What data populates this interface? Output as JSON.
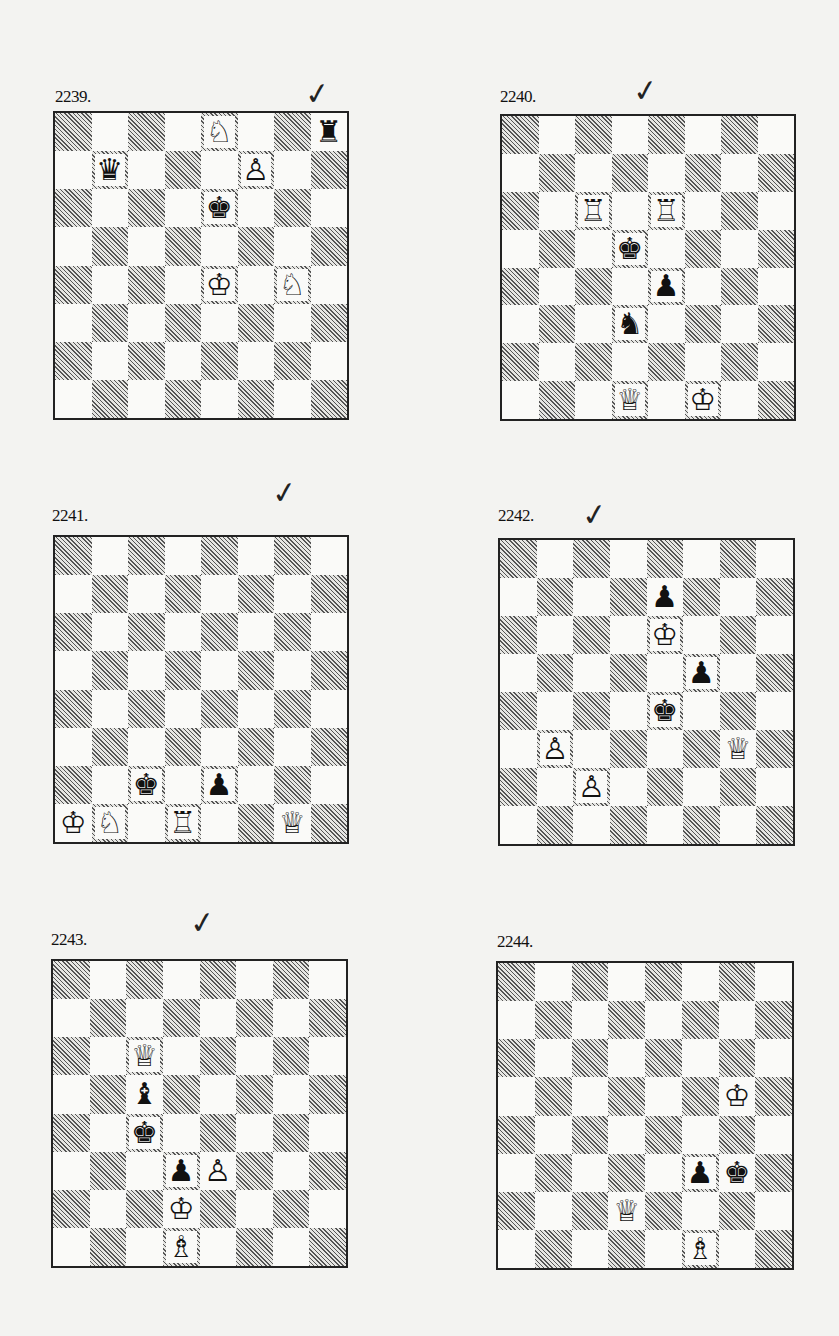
{
  "page": {
    "diagrams": [
      {
        "number": "2239.",
        "checked": true,
        "check_mark": "✓",
        "label_pos": [
          55,
          87
        ],
        "check_pos": [
          305,
          79
        ],
        "board": {
          "x": 53,
          "y": 111,
          "w": 296,
          "h": 309
        },
        "pieces": [
          {
            "square": "e8",
            "color": "white",
            "type": "knight",
            "glyph": "♘"
          },
          {
            "square": "h8",
            "color": "black",
            "type": "rook",
            "glyph": "♜"
          },
          {
            "square": "b7",
            "color": "black",
            "type": "queen",
            "glyph": "♛"
          },
          {
            "square": "f7",
            "color": "white",
            "type": "pawn",
            "glyph": "♙"
          },
          {
            "square": "e6",
            "color": "black",
            "type": "king",
            "glyph": "♚"
          },
          {
            "square": "e4",
            "color": "white",
            "type": "king",
            "glyph": "♔"
          },
          {
            "square": "g4",
            "color": "white",
            "type": "knight",
            "glyph": "♘"
          }
        ]
      },
      {
        "number": "2240.",
        "checked": true,
        "check_mark": "✓",
        "label_pos": [
          500,
          87
        ],
        "check_pos": [
          633,
          76
        ],
        "board": {
          "x": 500,
          "y": 114,
          "w": 296,
          "h": 307
        },
        "pieces": [
          {
            "square": "c6",
            "color": "white",
            "type": "rook",
            "glyph": "♖"
          },
          {
            "square": "e6",
            "color": "white",
            "type": "rook",
            "glyph": "♖"
          },
          {
            "square": "d5",
            "color": "black",
            "type": "king",
            "glyph": "♚"
          },
          {
            "square": "e4",
            "color": "black",
            "type": "pawn",
            "glyph": "♟"
          },
          {
            "square": "d3",
            "color": "black",
            "type": "knight",
            "glyph": "♞"
          },
          {
            "square": "d1",
            "color": "white",
            "type": "queen",
            "glyph": "♕"
          },
          {
            "square": "f1",
            "color": "white",
            "type": "king",
            "glyph": "♔"
          }
        ]
      },
      {
        "number": "2241.",
        "checked": true,
        "check_mark": "✓",
        "label_pos": [
          52,
          506
        ],
        "check_pos": [
          272,
          478
        ],
        "board": {
          "x": 53,
          "y": 535,
          "w": 296,
          "h": 309
        },
        "pieces": [
          {
            "square": "c2",
            "color": "black",
            "type": "king",
            "glyph": "♚"
          },
          {
            "square": "e2",
            "color": "black",
            "type": "pawn",
            "glyph": "♟"
          },
          {
            "square": "a1",
            "color": "white",
            "type": "king",
            "glyph": "♔"
          },
          {
            "square": "b1",
            "color": "white",
            "type": "knight",
            "glyph": "♘"
          },
          {
            "square": "d1",
            "color": "white",
            "type": "rook",
            "glyph": "♖"
          },
          {
            "square": "g1",
            "color": "white",
            "type": "queen",
            "glyph": "♕"
          }
        ]
      },
      {
        "number": "2242.",
        "checked": true,
        "check_mark": "✓",
        "label_pos": [
          498,
          506
        ],
        "check_pos": [
          582,
          500
        ],
        "board": {
          "x": 498,
          "y": 538,
          "w": 297,
          "h": 308
        },
        "pieces": [
          {
            "square": "e7",
            "color": "black",
            "type": "pawn",
            "glyph": "♟"
          },
          {
            "square": "e6",
            "color": "white",
            "type": "king",
            "glyph": "♔"
          },
          {
            "square": "f5",
            "color": "black",
            "type": "pawn",
            "glyph": "♟"
          },
          {
            "square": "e4",
            "color": "black",
            "type": "king",
            "glyph": "♚"
          },
          {
            "square": "b3",
            "color": "white",
            "type": "pawn",
            "glyph": "♙"
          },
          {
            "square": "g3",
            "color": "white",
            "type": "queen",
            "glyph": "♕"
          },
          {
            "square": "c2",
            "color": "white",
            "type": "pawn",
            "glyph": "♙"
          }
        ]
      },
      {
        "number": "2243.",
        "checked": true,
        "check_mark": "✓",
        "label_pos": [
          51,
          930
        ],
        "check_pos": [
          190,
          908
        ],
        "board": {
          "x": 51,
          "y": 959,
          "w": 297,
          "h": 309
        },
        "pieces": [
          {
            "square": "c6",
            "color": "white",
            "type": "queen",
            "glyph": "♕"
          },
          {
            "square": "c5",
            "color": "black",
            "type": "bishop",
            "glyph": "♝"
          },
          {
            "square": "c4",
            "color": "black",
            "type": "king",
            "glyph": "♚"
          },
          {
            "square": "d3",
            "color": "black",
            "type": "pawn",
            "glyph": "♟"
          },
          {
            "square": "e3",
            "color": "white",
            "type": "pawn",
            "glyph": "♙"
          },
          {
            "square": "d2",
            "color": "white",
            "type": "king",
            "glyph": "♔"
          },
          {
            "square": "d1",
            "color": "white",
            "type": "bishop",
            "glyph": "♗"
          }
        ]
      },
      {
        "number": "2244.",
        "checked": false,
        "check_mark": "",
        "label_pos": [
          497,
          932
        ],
        "check_pos": [
          0,
          0
        ],
        "board": {
          "x": 496,
          "y": 961,
          "w": 298,
          "h": 309
        },
        "pieces": [
          {
            "square": "g5",
            "color": "white",
            "type": "king",
            "glyph": "♔"
          },
          {
            "square": "f3",
            "color": "black",
            "type": "pawn",
            "glyph": "♟"
          },
          {
            "square": "g3",
            "color": "black",
            "type": "king",
            "glyph": "♚"
          },
          {
            "square": "d2",
            "color": "white",
            "type": "queen",
            "glyph": "♕"
          },
          {
            "square": "f1",
            "color": "white",
            "type": "bishop",
            "glyph": "♗"
          }
        ]
      }
    ],
    "colors": {
      "paper": "#f3f3f1",
      "light_square": "#fafaf8",
      "dark_square_hatch": "#555555",
      "border": "#222222"
    }
  }
}
